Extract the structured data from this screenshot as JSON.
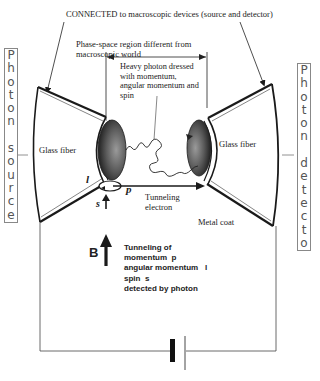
{
  "top_label": "CONNECTED  to macroscopic devices (source and detector)",
  "phase_space_label": "Phase-space region different from macroscopic world",
  "heavy_photon_label": "Heavy photon dressed with momentum, angular momentum and spin",
  "left_fiber_label": "Glass fiber",
  "right_fiber_label": "Glass fiber",
  "tunneling_electron_label": "Tunneling electron",
  "metal_coat_label": "Metal coat",
  "symbols": {
    "l": "l",
    "p": "p",
    "s": "s",
    "B": "B"
  },
  "tunneling_info": {
    "line1": "Tunneling of",
    "line2": "momentum  p",
    "line3": "angular momentum   l",
    "line4": "spin  s",
    "line5": "detected by photon"
  },
  "photon_source_letters": [
    "P",
    "h",
    "o",
    "t",
    "o",
    "n",
    " ",
    "s",
    "o",
    "u",
    "r",
    "c",
    "e"
  ],
  "photon_detector_letters": [
    "P",
    "h",
    "o",
    "t",
    "o",
    "n",
    " ",
    "d",
    "e",
    "t",
    "e",
    "c",
    "t",
    "o",
    "r"
  ],
  "colors": {
    "line": "#1a1a1a",
    "tip": "#555555",
    "box_border": "#888888",
    "box_text": "#555555"
  }
}
